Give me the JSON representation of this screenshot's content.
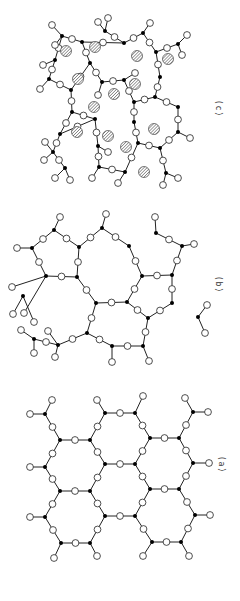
{
  "figure": {
    "colors": {
      "bond": "#222222",
      "network_former": "#000000",
      "bridging_atom_fill": "#ffffff",
      "atom_stroke": "#222222",
      "modifier_hatch": "#555555"
    },
    "panels": [
      {
        "id": "a",
        "label": "(a)",
        "title": "Regular crystalline network"
      },
      {
        "id": "b",
        "label": "(b)",
        "title": "Random glass network"
      },
      {
        "id": "c",
        "label": "(c)",
        "title": "Modified random network"
      }
    ]
  }
}
